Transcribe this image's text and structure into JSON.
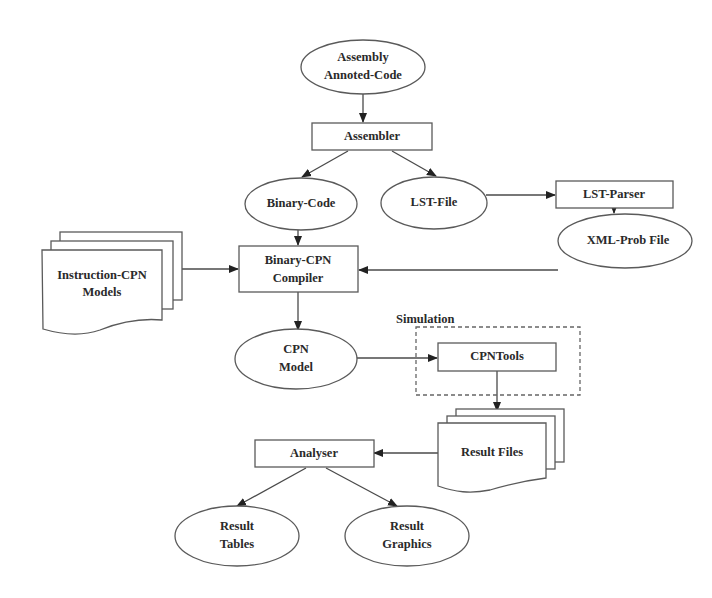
{
  "diagram": {
    "type": "flowchart",
    "nodes": {
      "assembly_code": {
        "shape": "ellipse",
        "lines": [
          "Assembly",
          "Annoted-Code"
        ]
      },
      "assembler": {
        "shape": "rect",
        "lines": [
          "Assembler"
        ]
      },
      "binary_code": {
        "shape": "ellipse",
        "lines": [
          "Binary-Code"
        ]
      },
      "lst_file": {
        "shape": "ellipse",
        "lines": [
          "LST-File"
        ]
      },
      "lst_parser": {
        "shape": "rect",
        "lines": [
          "LST-Parser"
        ]
      },
      "xml_prob_file": {
        "shape": "ellipse",
        "lines": [
          "XML-Prob File"
        ]
      },
      "instruction_cpn_models": {
        "shape": "multi-document",
        "lines": [
          "Instruction-CPN",
          "Models"
        ]
      },
      "binary_cpn_compiler": {
        "shape": "rect",
        "lines": [
          "Binary-CPN",
          "Compiler"
        ]
      },
      "cpn_model": {
        "shape": "ellipse",
        "lines": [
          "CPN",
          "Model"
        ]
      },
      "cpntools": {
        "shape": "rect",
        "lines": [
          "CPNTools"
        ]
      },
      "result_files": {
        "shape": "multi-document",
        "lines": [
          "Result Files"
        ]
      },
      "analyser": {
        "shape": "rect",
        "lines": [
          "Analyser"
        ]
      },
      "result_tables": {
        "shape": "ellipse",
        "lines": [
          "Result",
          "Tables"
        ]
      },
      "result_graphics": {
        "shape": "ellipse",
        "lines": [
          "Result",
          "Graphics"
        ]
      }
    },
    "groups": {
      "simulation": {
        "label": "Simulation",
        "contains": [
          "cpntools"
        ]
      }
    },
    "edges": [
      {
        "from": "assembly_code",
        "to": "assembler"
      },
      {
        "from": "assembler",
        "to": "binary_code"
      },
      {
        "from": "assembler",
        "to": "lst_file"
      },
      {
        "from": "lst_file",
        "to": "lst_parser"
      },
      {
        "from": "lst_parser",
        "to": "xml_prob_file"
      },
      {
        "from": "binary_code",
        "to": "binary_cpn_compiler"
      },
      {
        "from": "instruction_cpn_models",
        "to": "binary_cpn_compiler"
      },
      {
        "from": "xml_prob_file",
        "to": "binary_cpn_compiler"
      },
      {
        "from": "binary_cpn_compiler",
        "to": "cpn_model"
      },
      {
        "from": "cpn_model",
        "to": "cpntools"
      },
      {
        "from": "cpntools",
        "to": "result_files"
      },
      {
        "from": "result_files",
        "to": "analyser"
      },
      {
        "from": "analyser",
        "to": "result_tables"
      },
      {
        "from": "analyser",
        "to": "result_graphics"
      }
    ]
  }
}
